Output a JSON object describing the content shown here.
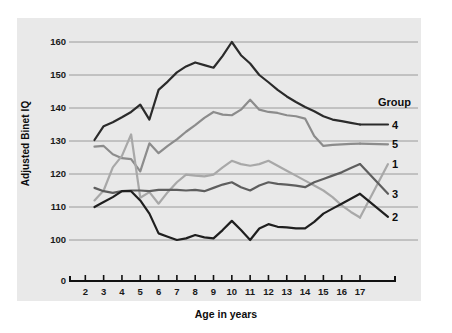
{
  "chart_data": {
    "type": "line",
    "title": "",
    "xlabel": "Age in years",
    "ylabel": "Adjusted Binet IQ",
    "xlim": [
      1.6,
      17.6
    ],
    "ylim": [
      96,
      163
    ],
    "y_axis_break_label": "0",
    "grid": true,
    "grid_axis": "y",
    "legend_position": "right",
    "legend_title": "Group",
    "xticks": [
      2,
      3,
      4,
      5,
      6,
      7,
      8,
      9,
      10,
      11,
      12,
      13,
      14,
      15,
      16,
      17
    ],
    "xtick_labels": [
      "2",
      "3",
      "4",
      "5",
      "6",
      "7",
      "8",
      "9",
      "10",
      "11",
      "12",
      "13",
      "14",
      "15",
      "16",
      "17"
    ],
    "yticks": [
      100,
      110,
      120,
      130,
      140,
      150,
      160
    ],
    "ytick_labels": [
      "100",
      "110",
      "120",
      "130",
      "140",
      "150",
      "160"
    ],
    "x": [
      2.5,
      3,
      3.5,
      4,
      4.5,
      5,
      5.5,
      6,
      6.5,
      7,
      7.5,
      8,
      8.5,
      9,
      9.5,
      10,
      10.5,
      11,
      11.5,
      12,
      12.5,
      13,
      13.5,
      14,
      14.5,
      15,
      15.5,
      16,
      16.5,
      17
    ],
    "series": [
      {
        "name": "4",
        "label": "4",
        "color": "#2b2b2b",
        "linewidth": 2.2,
        "legend_y_value": 135,
        "values": [
          130.3,
          134.5,
          135.7,
          137.2,
          138.8,
          141.0,
          136.5,
          145.5,
          148.0,
          150.8,
          152.6,
          153.8,
          153.0,
          152.2,
          155.8,
          160.0,
          156.0,
          153.5,
          150.0,
          147.8,
          145.5,
          143.5,
          141.8,
          140.3,
          139.0,
          137.5,
          136.5,
          136.0,
          135.5,
          135.0
        ]
      },
      {
        "name": "5",
        "label": "5",
        "color": "#8c8c8c",
        "linewidth": 2.2,
        "legend_y_value": 129,
        "values": [
          128.3,
          128.5,
          126.0,
          124.8,
          124.5,
          120.8,
          129.3,
          126.3,
          128.5,
          130.5,
          132.8,
          134.8,
          137.0,
          138.8,
          138.0,
          137.8,
          139.5,
          142.5,
          139.5,
          138.8,
          138.5,
          137.8,
          137.5,
          136.8,
          131.5,
          128.5,
          128.8,
          129.0,
          129.1,
          129.2
        ]
      },
      {
        "name": "1",
        "label": "1",
        "color": "#a8a8a8",
        "linewidth": 2.2,
        "legend_y_value": 123,
        "values": [
          112.0,
          115.0,
          122.0,
          125.5,
          132.0,
          112.8,
          114.5,
          111.0,
          114.5,
          117.5,
          119.8,
          119.5,
          119.3,
          119.8,
          122.0,
          124.0,
          123.0,
          122.5,
          123.0,
          124.0,
          122.5,
          121.0,
          119.5,
          118.0,
          116.5,
          115.0,
          113.0,
          110.5,
          108.5,
          106.8
        ]
      },
      {
        "name": "3",
        "label": "3",
        "color": "#5e5e5e",
        "linewidth": 2.2,
        "legend_y_value": 114,
        "values": [
          115.8,
          114.8,
          114.3,
          114.8,
          115.0,
          115.0,
          114.8,
          115.2,
          115.2,
          115.2,
          115.0,
          115.2,
          114.8,
          115.8,
          116.8,
          117.5,
          116.0,
          115.0,
          116.5,
          117.5,
          117.0,
          116.8,
          116.5,
          116.0,
          117.5,
          118.5,
          119.5,
          120.5,
          121.8,
          123.0
        ]
      },
      {
        "name": "2",
        "label": "2",
        "color": "#1f1f1f",
        "linewidth": 2.2,
        "legend_y_value": 107,
        "values": [
          110.0,
          111.5,
          113.0,
          114.8,
          114.8,
          112.0,
          108.0,
          102.0,
          101.0,
          100.0,
          100.5,
          101.5,
          100.8,
          100.5,
          103.0,
          105.8,
          103.0,
          100.0,
          103.5,
          104.8,
          104.0,
          103.8,
          103.5,
          103.5,
          105.5,
          108.0,
          109.5,
          111.0,
          112.5,
          114.0
        ]
      }
    ]
  }
}
